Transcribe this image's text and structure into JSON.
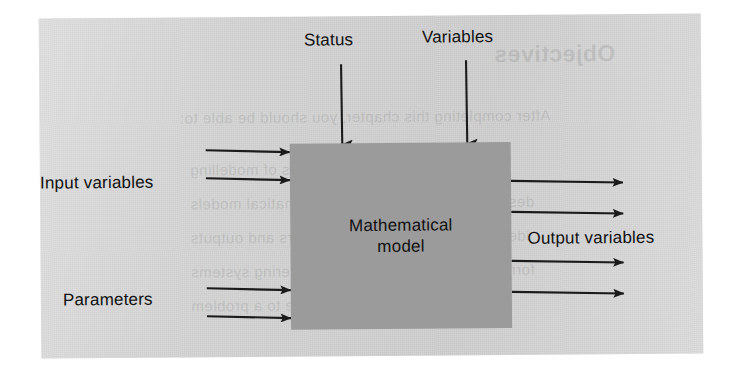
{
  "figure": {
    "kind": "block-diagram",
    "caption_visible": false,
    "model_box": {
      "label_line_1": "Mathematical",
      "label_line_2": "model",
      "fill_color": "#9b9b9b"
    },
    "panel": {
      "background_color": "#d2d2d2",
      "page_color": "#ffffff"
    },
    "ink_color": "#1b1b1b",
    "labels": {
      "status": "Status",
      "variables": "Variables",
      "input_variables": "Input variables",
      "parameters": "Parameters",
      "output_variables": "Output variables"
    },
    "arrows": {
      "top_inputs": [
        {
          "name": "status",
          "direction": "down",
          "count": 1
        },
        {
          "name": "variables",
          "direction": "down",
          "count": 1
        }
      ],
      "left_inputs": [
        {
          "name": "input-variables",
          "direction": "right",
          "count": 2
        },
        {
          "name": "parameters",
          "direction": "right",
          "count": 2
        }
      ],
      "right_outputs": [
        {
          "name": "output-variables",
          "direction": "right",
          "count": 4
        }
      ]
    },
    "ghost_text": [
      "Objectives",
      "After completing this chapter, you should be able to:",
      "understand the basic concepts of modelling",
      "describe the main types of mathematical models",
      "identify input variables, parameters and outputs",
      "formulate simple models of engineering systems",
      "apply the modelling procedure to a problem"
    ]
  }
}
